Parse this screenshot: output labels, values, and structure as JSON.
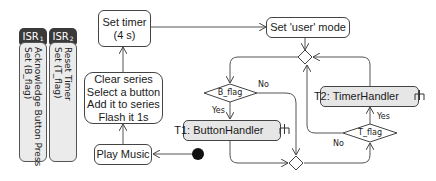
{
  "isr": [
    {
      "title": "ISR",
      "sub": "1",
      "lines": "Acknowledge Button Press\nSet (B_flag)"
    },
    {
      "title": "ISR",
      "sub": "2",
      "lines": "Reset Timer\nSet (T_flag)"
    }
  ],
  "nodes": {
    "set_timer": "Set timer\n(4 s)",
    "clear_series": "Clear series\nSelect a button\nAdd it to series\nFlash it 1s",
    "play_music": "Play Music",
    "set_user_mode": "Set 'user' mode",
    "t1": "T1: ButtonHandler",
    "t2": "T2: TimerHandler"
  },
  "decisions": {
    "b_flag": "B_flag",
    "t_flag": "T_flag"
  },
  "edge_labels": {
    "b_no": "No",
    "b_yes": "Yes",
    "t_no": "No",
    "t_yes": "Yes"
  },
  "icons": {
    "rake": "rake-icon"
  }
}
